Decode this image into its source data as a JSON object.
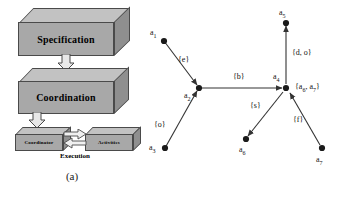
{
  "figure": {
    "panel_a": {
      "caption": "(a)",
      "blocks": [
        {
          "id": "specification",
          "label": "Specification"
        },
        {
          "id": "coordination",
          "label": "Coordination"
        },
        {
          "id": "coordinator",
          "label": "Coordinator"
        },
        {
          "id": "activities",
          "label": "Activities"
        }
      ],
      "execution_label": "Execution",
      "arrows": [
        {
          "from": "specification",
          "to": "coordination",
          "style": "hollow-down"
        },
        {
          "from": "coordination",
          "to": "coordinator",
          "style": "hollow-down"
        },
        {
          "from": "coordinator",
          "to": "activities",
          "style": "hollow-right"
        },
        {
          "from": "activities",
          "to": "coordinator",
          "style": "hollow-left"
        }
      ]
    },
    "panel_b": {
      "caption": "(b)",
      "nodes": [
        {
          "id": "a1",
          "label": "a",
          "sub": "1"
        },
        {
          "id": "a2",
          "label": "a",
          "sub": "2"
        },
        {
          "id": "a3",
          "label": "a",
          "sub": "3"
        },
        {
          "id": "a4",
          "label": "a",
          "sub": "4"
        },
        {
          "id": "a5",
          "label": "a",
          "sub": "5"
        },
        {
          "id": "a6",
          "label": "a",
          "sub": "6"
        },
        {
          "id": "a7",
          "label": "a",
          "sub": "7"
        }
      ],
      "edges": [
        {
          "from": "a1",
          "to": "a2",
          "label": "{e}"
        },
        {
          "from": "a3",
          "to": "a2",
          "label": "{o}"
        },
        {
          "from": "a2",
          "to": "a4",
          "label": "{b}"
        },
        {
          "from": "a4",
          "to": "a5",
          "label": "{d, o}"
        },
        {
          "from": "a4",
          "to": "a6",
          "label": "{s}"
        },
        {
          "from": "a7",
          "to": "a4",
          "label": "{f}"
        }
      ],
      "annotations": [
        {
          "near": "a4",
          "text": "{a6, a7}",
          "text_parts": [
            "{a",
            "6",
            ", a",
            "7",
            "}"
          ]
        }
      ]
    }
  },
  "colors": {
    "block_front": "#a8a8a8",
    "block_top": "#c2c2c2",
    "block_side": "#8f8f8f",
    "outline": "#4a4a4a",
    "graph_stroke": "#333333",
    "text": "#000000",
    "background": "#ffffff"
  }
}
